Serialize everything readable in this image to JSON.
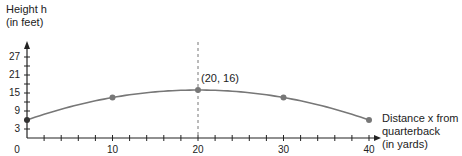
{
  "chart_data": {
    "type": "line",
    "title": "",
    "ylabel_line1": "Height h",
    "ylabel_line2": "(in feet)",
    "xlabel_line1": "Distance x from",
    "xlabel_line2": "quarterback",
    "xlabel_line3": "(in yards)",
    "x": [
      0,
      10,
      20,
      30,
      40
    ],
    "series": [
      {
        "name": "Football path",
        "values": [
          6,
          13.5,
          16,
          13.5,
          6
        ]
      }
    ],
    "xlim": [
      0,
      40
    ],
    "ylim": [
      0,
      27
    ],
    "x_ticks_labeled": [
      "0",
      "10",
      "20",
      "30",
      "40"
    ],
    "x_minor_tick_step": 2,
    "y_ticks_labeled": [
      "3",
      "9",
      "15",
      "21",
      "27"
    ],
    "y_minor_tick_step": 3,
    "vertex": {
      "x": 20,
      "y": 16,
      "label": "(20, 16)"
    },
    "axis_of_symmetry": {
      "x": 20,
      "style": "dashed"
    },
    "grid": false,
    "colors": {
      "curve": "#777777",
      "points": "#777777",
      "axis": "#222222",
      "dashed": "#777777"
    }
  }
}
